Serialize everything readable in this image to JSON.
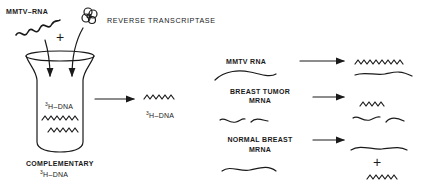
{
  "left_panel": {
    "mmtv_rna_label": "MMTV–RNA",
    "reverse_transcriptase_label": "REVERSE TRANSCRIPTASE",
    "plus_sign": "+",
    "tube_content_label_sup": "3",
    "tube_content_label": "H–DNA",
    "product_label_sup": "3",
    "product_label": "H–DNA",
    "complementary_label": "COMPLEMENTARY",
    "complementary_sub_sup": "3",
    "complementary_sub": "H–DNA"
  },
  "right_panel": {
    "rows": [
      {
        "label_line1": "MMTV  RNA",
        "label_line2": ""
      },
      {
        "label_line1": "BREAST  TUMOR",
        "label_line2": "MRNA"
      },
      {
        "label_line1": "NORMAL  BREAST",
        "label_line2": "MRNA"
      }
    ],
    "plus_sign": "+"
  },
  "colors": {
    "ink": "#1a1a1a",
    "background": "#ffffff"
  }
}
